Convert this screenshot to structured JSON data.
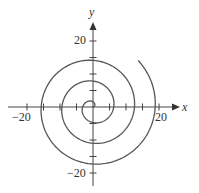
{
  "chart_data": {
    "type": "line",
    "title": "",
    "xlabel": "x",
    "ylabel": "y",
    "xlim": [
      -25,
      25
    ],
    "ylim": [
      -25,
      25
    ],
    "x_tick_labels": [
      "−20",
      "20"
    ],
    "y_tick_labels": [
      "20",
      "−20"
    ],
    "x_ticks": [
      -20,
      -15,
      -10,
      -5,
      0,
      5,
      10,
      15,
      20
    ],
    "y_ticks": [
      -20,
      -15,
      -10,
      -5,
      0,
      5,
      10,
      15,
      20
    ],
    "grid": false,
    "legend": null,
    "series": [
      {
        "name": "spiral r = θ",
        "theta_range": [
          0,
          19.65
        ],
        "color": "#555555"
      }
    ],
    "scale": {
      "origin_px": [
        93,
        107
      ],
      "px_per_unit": 3.3
    }
  },
  "labels": {
    "x_axis": "x",
    "y_axis": "y",
    "x_neg": "−20",
    "x_pos": "20",
    "y_pos": "20",
    "y_neg": "−20"
  }
}
